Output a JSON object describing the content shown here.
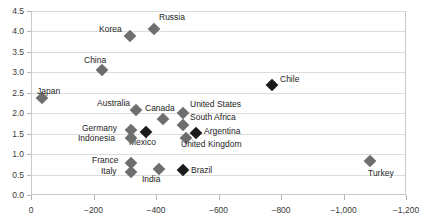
{
  "chart_data": {
    "type": "scatter",
    "title": "",
    "xlabel": "",
    "ylabel": "",
    "xlim": [
      0,
      -1200
    ],
    "ylim": [
      0.0,
      4.5
    ],
    "x_ticks": [
      "0",
      "−200",
      "−400",
      "−600",
      "−800",
      "−1,000",
      "−1,200"
    ],
    "x_tick_values": [
      0,
      -200,
      -400,
      -600,
      -800,
      -1000,
      -1200
    ],
    "y_ticks": [
      "0.0",
      "0.5",
      "1.0",
      "1.5",
      "2.0",
      "2.5",
      "3.0",
      "3.5",
      "4.0",
      "4.5"
    ],
    "y_tick_values": [
      0.0,
      0.5,
      1.0,
      1.5,
      2.0,
      2.5,
      3.0,
      3.5,
      4.0,
      4.5
    ],
    "grid": "horizontal",
    "legend": "none",
    "marker_shape": "diamond",
    "colors": {
      "gray": "#6e6e6e",
      "black": "#1a1a1a",
      "grid": "#dcdcdc",
      "frame": "#c9c9c9",
      "text": "#1e1e1e"
    },
    "points": [
      {
        "label": "Japan",
        "x": -35,
        "y": 2.37,
        "color": "gray",
        "lx": 37,
        "ly": 87
      },
      {
        "label": "China",
        "x": -227,
        "y": 3.05,
        "color": "gray",
        "lx": 84,
        "ly": 56
      },
      {
        "label": "Korea",
        "x": -317,
        "y": 3.88,
        "color": "gray",
        "lx": 99,
        "ly": 25
      },
      {
        "label": "Russia",
        "x": -394,
        "y": 4.05,
        "color": "gray",
        "lx": 159,
        "ly": 13
      },
      {
        "label": "Australia",
        "x": -336,
        "y": 2.08,
        "color": "gray",
        "lx": 97,
        "ly": 99
      },
      {
        "label": "Canada",
        "x": -422,
        "y": 1.85,
        "color": "gray",
        "lx": 145,
        "ly": 104
      },
      {
        "label": "United States",
        "x": -486,
        "y": 2.0,
        "color": "gray",
        "lx": 190,
        "ly": 100
      },
      {
        "label": "South Africa",
        "x": -486,
        "y": 1.7,
        "color": "gray",
        "lx": 190,
        "ly": 113
      },
      {
        "label": "Germany",
        "x": -320,
        "y": 1.58,
        "color": "gray",
        "lx": 82,
        "ly": 124
      },
      {
        "label": "Mexico",
        "x": -368,
        "y": 1.54,
        "color": "black",
        "lx": 129,
        "ly": 138
      },
      {
        "label": "Argentina",
        "x": -528,
        "y": 1.52,
        "color": "black",
        "lx": 204,
        "ly": 127
      },
      {
        "label": "United Kingdom",
        "x": -496,
        "y": 1.4,
        "color": "gray",
        "lx": 181,
        "ly": 140
      },
      {
        "label": "Indonesia",
        "x": -320,
        "y": 1.4,
        "color": "gray",
        "lx": 78,
        "ly": 134
      },
      {
        "label": "France",
        "x": -320,
        "y": 0.78,
        "color": "gray",
        "lx": 92,
        "ly": 156
      },
      {
        "label": "Italy",
        "x": -320,
        "y": 0.56,
        "color": "gray",
        "lx": 101,
        "ly": 167
      },
      {
        "label": "India",
        "x": -410,
        "y": 0.63,
        "color": "gray",
        "lx": 142,
        "ly": 175
      },
      {
        "label": "Brazil",
        "x": -486,
        "y": 0.6,
        "color": "black",
        "lx": 191,
        "ly": 166
      },
      {
        "label": "Chile",
        "x": -771,
        "y": 2.7,
        "color": "black",
        "lx": 280,
        "ly": 75
      },
      {
        "label": "Turkey",
        "x": -1085,
        "y": 0.82,
        "color": "gray",
        "lx": 368,
        "ly": 169
      }
    ]
  }
}
